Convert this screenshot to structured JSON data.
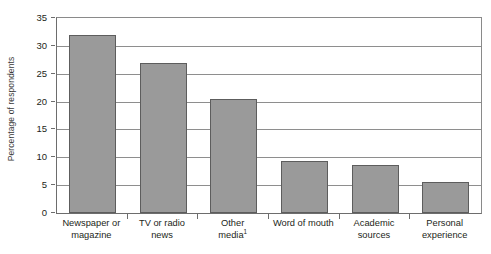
{
  "chart_data": {
    "type": "bar",
    "title": "",
    "xlabel": "",
    "ylabel": "Percentage of respondents",
    "categories": [
      "Newspaper or magazine",
      "TV or radio news",
      "Other media",
      "Word of mouth",
      "Academic sources",
      "Personal experience"
    ],
    "category_lines": [
      [
        "Newspaper or",
        "magazine"
      ],
      [
        "TV or radio",
        "news"
      ],
      [
        "Other",
        "media"
      ],
      [
        "Word of mouth"
      ],
      [
        "Academic",
        "sources"
      ],
      [
        "Personal",
        "experience"
      ]
    ],
    "footnote_markers": [
      "",
      "",
      "1",
      "",
      "",
      ""
    ],
    "values": [
      32.0,
      27.0,
      20.4,
      9.4,
      8.6,
      5.6
    ],
    "ylim": [
      0,
      35
    ],
    "ytick_labels": [
      "0",
      "5",
      "10",
      "15",
      "20",
      "25",
      "30",
      "35"
    ],
    "ytick_values": [
      0,
      5,
      10,
      15,
      20,
      25,
      30,
      35
    ],
    "grid": true,
    "legend": "none",
    "bar_color": "#9a9a9a",
    "bar_border_color": "#5d5d5d",
    "axis_color": "#6d6d6d",
    "grid_color": "#8e8e8e",
    "background_color": "#ffffff"
  }
}
